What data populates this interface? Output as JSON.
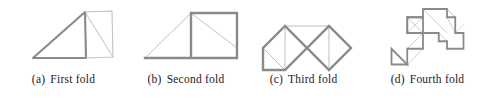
{
  "figure": {
    "type": "paper-folding-sequence",
    "colors": {
      "outline": "#8a8a8a",
      "crease": "#b8b8b8",
      "caption_text": "#1a1a1a",
      "background": "#ffffff"
    },
    "stroke_widths": {
      "outline": 2.2,
      "crease": 0.9
    },
    "panels": [
      {
        "id": "a",
        "tag": "(a)",
        "label": "First fold",
        "caption": "(a)  First fold",
        "outline_points": "30,58 86,10 88,58 30,58",
        "polylines": [
          "33,57 85,11 86,57 33,57",
          "85,11 112,10 113,56 86,57"
        ],
        "creases": [
          "85,11 113,56",
          "85,11 86,57"
        ]
      },
      {
        "id": "b",
        "tag": "(b)",
        "label": "Second fold",
        "caption": "(b)  Second fold",
        "polylines": [
          "18,57 64,57 64,12 110,12 110,57 64,57",
          "18,57 64,12"
        ],
        "creases": [
          "64,12 110,47",
          "18,57 64,12"
        ]
      },
      {
        "id": "c",
        "tag": "(c)",
        "label": "Third fold",
        "caption": "(c)  Third fold",
        "polylines": [
          "18,48 40,70 18,70 18,48",
          "40,70 18,48 40,26 62,48 84,26 106,48 84,70 62,48 40,70"
        ],
        "creases": [
          "40,26 84,26",
          "40,26 40,70",
          "84,26 84,70",
          "18,48 40,70"
        ]
      },
      {
        "id": "d",
        "tag": "(d)",
        "label": "Fourth fold",
        "caption": "(d)  Fourth fold",
        "polylines": [
          "14,65 14,86 35,86 14,65",
          "35,86 35,65 56,65 56,44 35,44 35,23 56,23 56,12 88,12 88,23 99,23 99,44 110,44 110,65 88,65 88,55 77,55 77,44 56,44",
          "35,23 56,23 56,44 35,44 35,23"
        ],
        "creases": [
          "35,23 56,44",
          "35,44 56,23",
          "56,12 88,44",
          "88,12 99,23",
          "99,44 110,33",
          "14,65 35,86",
          "35,65 56,44",
          "56,65 35,86",
          "88,23 99,44",
          "99,23 88,12",
          "77,44 88,55"
        ]
      }
    ]
  }
}
